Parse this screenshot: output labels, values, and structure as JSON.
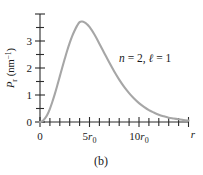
{
  "figure": {
    "caption": "(b)",
    "annotation": "n = 2, ℓ = 1",
    "annotation_parts": {
      "n_symbol": "n",
      "n_eq": "= 2,",
      "l_symbol": "ℓ",
      "l_eq": "= 1"
    },
    "background_color": "#ffffff",
    "curve_color": "#a6a6a6",
    "axis_color": "#2b2b2b"
  },
  "axes": {
    "x": {
      "name": "r",
      "tick_labels": [
        "0",
        "5r0",
        "10r0"
      ],
      "tick_label_display": [
        "0",
        "5",
        "10"
      ],
      "tick_label_subscript": [
        "",
        "0",
        "0"
      ],
      "tick_label_unit": [
        "",
        "r",
        "r"
      ],
      "major_positions": [
        0,
        5,
        10
      ],
      "minor_step": 1,
      "range": [
        0,
        15
      ]
    },
    "y": {
      "label": "P_r (nm^-1)",
      "label_parts": {
        "symbol": "P",
        "subscript": "r",
        "unit_open": " (nm",
        "unit_exp": "−1",
        "unit_close": ")"
      },
      "tick_labels": [
        "0",
        "1",
        "2",
        "3"
      ],
      "major_positions": [
        0,
        1,
        2,
        3
      ],
      "minor_step": 0.5,
      "range": [
        0,
        4
      ]
    }
  },
  "chart_data": {
    "type": "line",
    "title": "",
    "subtitle": "",
    "xlabel": "r",
    "ylabel": "P_r (nm^-1)",
    "xlim": [
      0,
      15
    ],
    "ylim": [
      0,
      4
    ],
    "xticks": [
      0,
      5,
      10
    ],
    "xticklabels": [
      "0",
      "5r0",
      "10r0"
    ],
    "yticks": [
      0,
      1,
      2,
      3
    ],
    "yticklabels": [
      "0",
      "1",
      "2",
      "3"
    ],
    "xminor_step": 1,
    "yminor_step": 0.5,
    "grid": false,
    "legend": false,
    "annotations": [
      {
        "text": "n = 2, ℓ = 1",
        "x": 8.2,
        "y": 2.55
      }
    ],
    "series": [
      {
        "name": "P_r for n=2, l=1",
        "color": "#a6a6a6",
        "peak_x": 4.0,
        "peak_y": 3.72,
        "x": [
          0.0,
          0.25,
          0.5,
          0.75,
          1.0,
          1.25,
          1.5,
          1.75,
          2.0,
          2.25,
          2.5,
          2.75,
          3.0,
          3.25,
          3.5,
          3.75,
          4.0,
          4.25,
          4.5,
          4.75,
          5.0,
          5.5,
          6.0,
          6.5,
          7.0,
          7.5,
          8.0,
          8.5,
          9.0,
          9.5,
          10.0,
          10.5,
          11.0,
          11.5,
          12.0,
          12.5,
          13.0,
          13.5,
          14.0,
          14.5,
          15.0
        ],
        "y": [
          0.0,
          0.03,
          0.13,
          0.28,
          0.49,
          0.75,
          1.04,
          1.36,
          1.69,
          2.02,
          2.34,
          2.65,
          2.93,
          3.18,
          3.39,
          3.57,
          3.7,
          3.72,
          3.69,
          3.62,
          3.52,
          3.24,
          2.9,
          2.55,
          2.2,
          1.87,
          1.57,
          1.3,
          1.07,
          0.87,
          0.7,
          0.56,
          0.44,
          0.35,
          0.27,
          0.21,
          0.16,
          0.13,
          0.1,
          0.07,
          0.05
        ]
      }
    ]
  }
}
